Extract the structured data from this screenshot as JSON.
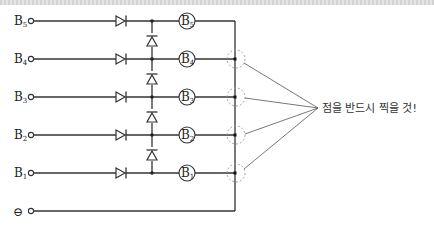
{
  "diagram": {
    "inputs": [
      {
        "label": "B",
        "sub": "5",
        "y": 21
      },
      {
        "label": "B",
        "sub": "4",
        "y": 59
      },
      {
        "label": "B",
        "sub": "3",
        "y": 97
      },
      {
        "label": "B",
        "sub": "2",
        "y": 135
      },
      {
        "label": "B",
        "sub": "1",
        "y": 173
      }
    ],
    "ground": {
      "symbol": "⊖",
      "y": 211
    },
    "lamps": [
      {
        "label": "B",
        "sub": "5"
      },
      {
        "label": "B",
        "sub": "4"
      },
      {
        "label": "B",
        "sub": "3"
      },
      {
        "label": "B",
        "sub": "2"
      },
      {
        "label": "B",
        "sub": "1"
      }
    ],
    "annotation": "점을 반드시 찍을 것!",
    "colors": {
      "wire": "#333333",
      "dashed_circle": "#999999",
      "text": "#222222"
    }
  }
}
